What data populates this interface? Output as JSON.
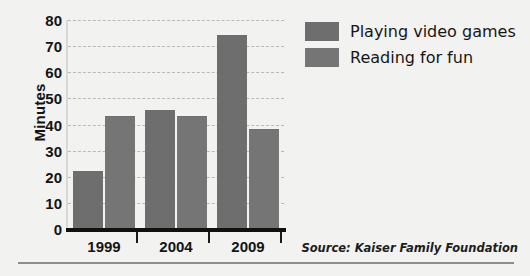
{
  "chart_data": {
    "type": "bar",
    "title": "",
    "subtitle": "",
    "xlabel": "",
    "ylabel": "Minutes",
    "categories": [
      "1999",
      "2004",
      "2009"
    ],
    "series": [
      {
        "name": "Playing video games",
        "values": [
          22,
          45,
          74
        ],
        "color": "#6e6e6e"
      },
      {
        "name": "Reading for fun",
        "values": [
          43,
          43,
          38
        ],
        "color": "#757575"
      }
    ],
    "ylim": [
      0,
      80
    ],
    "ytick_values": [
      0,
      10,
      20,
      30,
      40,
      50,
      60,
      70,
      80
    ],
    "ytick_labels": [
      "0",
      "10",
      "20",
      "30",
      "40",
      "50",
      "60",
      "70",
      "80"
    ],
    "grid": true,
    "grid_style": "dashed",
    "grid_color": "#b9b9b7",
    "legend_position": "top-right",
    "annotations": [
      "Source: Kaiser Family Foundation"
    ]
  },
  "legend": {
    "items": [
      {
        "label": "Playing video games",
        "color": "#6e6e6e"
      },
      {
        "label": "Reading for fun",
        "color": "#757575"
      }
    ]
  },
  "source": {
    "text": "Source: Kaiser Family Foundation"
  },
  "colors": {
    "background": "#f2f2f0",
    "bar": "#6e6e6e",
    "axis": "#111111",
    "grid": "#b9b9b7",
    "text": "#141414"
  }
}
